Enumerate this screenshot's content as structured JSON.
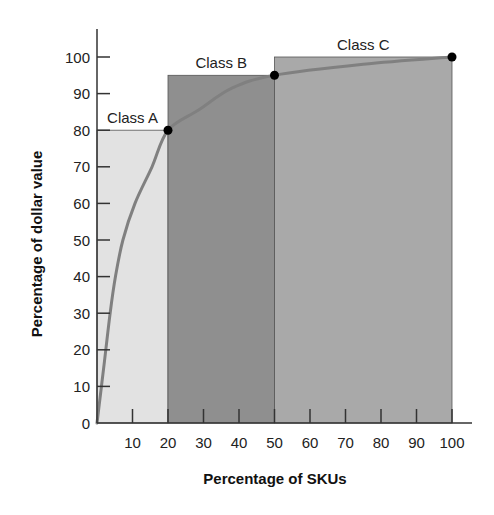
{
  "chart_data": {
    "type": "area",
    "title": "",
    "xlabel": "Percentage of SKUs",
    "ylabel": "Percentage of dollar value",
    "xlim": [
      0,
      100
    ],
    "ylim": [
      0,
      100
    ],
    "grid": false,
    "x_ticks": [
      10,
      20,
      30,
      40,
      50,
      60,
      70,
      80,
      90,
      100
    ],
    "y_ticks": [
      0,
      10,
      20,
      30,
      40,
      50,
      60,
      70,
      80,
      90,
      100
    ],
    "classes": [
      {
        "name": "Class A",
        "x_start": 0,
        "x_end": 20,
        "height": 80,
        "color": "#e2e2e2"
      },
      {
        "name": "Class B",
        "x_start": 20,
        "x_end": 50,
        "height": 95,
        "color": "#8f8f8f"
      },
      {
        "name": "Class C",
        "x_start": 50,
        "x_end": 100,
        "height": 100,
        "color": "#a9a9a9"
      }
    ],
    "curve": {
      "name": "Cumulative dollar value",
      "color": "#808080",
      "x": [
        0,
        1,
        2,
        3.7,
        5.2,
        7.3,
        10.7,
        15.5,
        20,
        28.6,
        38,
        50,
        75,
        100
      ],
      "y": [
        0,
        8,
        16,
        30,
        40,
        50,
        60,
        70,
        80,
        85.5,
        91.5,
        95,
        98,
        100
      ]
    },
    "markers": [
      {
        "x": 20,
        "y": 80
      },
      {
        "x": 50,
        "y": 95
      },
      {
        "x": 100,
        "y": 100
      }
    ]
  }
}
